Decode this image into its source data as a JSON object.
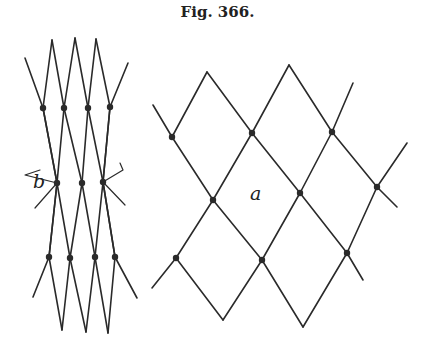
{
  "figure": {
    "title": "Fig. 366.",
    "labels": {
      "left_net": "b",
      "right_net": "a"
    },
    "ink_color": "#2a2a2a",
    "background": "#ffffff"
  },
  "nets": [
    {
      "name": "b",
      "description": "Net stretched lengthwise; meshes elongated into narrow diamonds",
      "label_pos": [
        33,
        188
      ],
      "lines": [
        [
          [
            25,
            58
          ],
          [
            43,
            108
          ],
          [
            57,
            183
          ],
          [
            49,
            257
          ],
          [
            33,
            297
          ]
        ],
        [
          [
            52,
            40
          ],
          [
            43,
            108
          ]
        ],
        [
          [
            52,
            40
          ],
          [
            64,
            108
          ],
          [
            82,
            183
          ],
          [
            95,
            257
          ],
          [
            108,
            333
          ]
        ],
        [
          [
            75,
            38
          ],
          [
            64,
            108
          ],
          [
            57,
            183
          ],
          [
            70,
            258
          ],
          [
            86,
            332
          ]
        ],
        [
          [
            75,
            38
          ],
          [
            88,
            108
          ],
          [
            103,
            182
          ],
          [
            115,
            257
          ],
          [
            137,
            298
          ]
        ],
        [
          [
            96,
            39
          ],
          [
            88,
            108
          ],
          [
            82,
            183
          ],
          [
            70,
            258
          ],
          [
            62,
            330
          ]
        ],
        [
          [
            96,
            39
          ],
          [
            110,
            107
          ],
          [
            103,
            182
          ],
          [
            95,
            257
          ],
          [
            86,
            332
          ]
        ],
        [
          [
            128,
            63
          ],
          [
            110,
            107
          ]
        ],
        [
          [
            43,
            108
          ],
          [
            57,
            183
          ],
          [
            49,
            257
          ],
          [
            62,
            330
          ]
        ],
        [
          [
            110,
            107
          ],
          [
            103,
            182
          ],
          [
            115,
            257
          ],
          [
            108,
            333
          ]
        ]
      ],
      "knots": [
        [
          43,
          108
        ],
        [
          64,
          108
        ],
        [
          88,
          108
        ],
        [
          110,
          107
        ],
        [
          57,
          183
        ],
        [
          82,
          183
        ],
        [
          103,
          182
        ],
        [
          49,
          257
        ],
        [
          70,
          258
        ],
        [
          95,
          257
        ],
        [
          115,
          257
        ]
      ],
      "stray_ends": [
        [
          [
            57,
            183
          ],
          [
            25,
            175
          ],
          [
            40,
            170
          ]
        ],
        [
          [
            57,
            183
          ],
          [
            35,
            208
          ]
        ],
        [
          [
            103,
            182
          ],
          [
            123,
            170
          ],
          [
            120,
            163
          ]
        ],
        [
          [
            103,
            182
          ],
          [
            125,
            205
          ]
        ]
      ]
    },
    {
      "name": "a",
      "description": "Net with square meshes opened into regular diamonds",
      "label_pos": [
        250,
        200
      ],
      "lines": [
        [
          [
            153,
            105
          ],
          [
            172,
            137
          ],
          [
            213,
            200
          ],
          [
            262,
            260
          ],
          [
            303,
            327
          ]
        ],
        [
          [
            207,
            72
          ],
          [
            252,
            133
          ],
          [
            300,
            193
          ],
          [
            347,
            253
          ],
          [
            363,
            280
          ]
        ],
        [
          [
            289,
            65
          ],
          [
            332,
            132
          ],
          [
            377,
            187
          ],
          [
            397,
            207
          ]
        ],
        [
          [
            207,
            72
          ],
          [
            172,
            137
          ]
        ],
        [
          [
            289,
            65
          ],
          [
            252,
            133
          ],
          [
            213,
            200
          ],
          [
            176,
            258
          ],
          [
            152,
            288
          ]
        ],
        [
          [
            353,
            83
          ],
          [
            332,
            132
          ],
          [
            300,
            193
          ],
          [
            262,
            260
          ],
          [
            223,
            320
          ]
        ],
        [
          [
            407,
            143
          ],
          [
            377,
            187
          ],
          [
            347,
            253
          ],
          [
            303,
            327
          ]
        ],
        [
          [
            176,
            258
          ],
          [
            223,
            320
          ]
        ]
      ],
      "knots": [
        [
          172,
          137
        ],
        [
          252,
          133
        ],
        [
          332,
          132
        ],
        [
          213,
          200
        ],
        [
          300,
          193
        ],
        [
          377,
          187
        ],
        [
          176,
          258
        ],
        [
          262,
          260
        ],
        [
          347,
          253
        ]
      ]
    }
  ]
}
